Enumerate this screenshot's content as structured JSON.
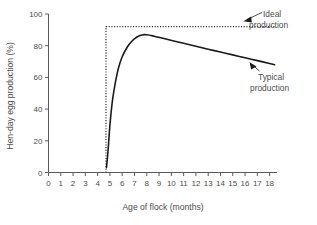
{
  "chart_data": {
    "type": "line",
    "title": "",
    "xlabel": "Age of flock (months)",
    "ylabel": "Hen-day egg production (%)",
    "xlim": [
      0,
      18.6
    ],
    "ylim": [
      0,
      100
    ],
    "grid": false,
    "legend_position": "inline-annotations",
    "x_ticks": [
      0,
      1,
      2,
      3,
      4,
      5,
      6,
      7,
      8,
      9,
      10,
      11,
      12,
      13,
      14,
      15,
      16,
      17,
      18
    ],
    "x_tick_labels": [
      "0",
      "1",
      "2",
      "3",
      "4",
      "5",
      "6",
      "7",
      "8",
      "9",
      "10",
      "11",
      "12",
      "13",
      "14",
      "15",
      "16",
      "17",
      "18"
    ],
    "y_ticks": [
      0,
      20,
      40,
      60,
      80,
      100
    ],
    "y_tick_labels": [
      "0",
      "20",
      "40",
      "60",
      "80",
      "100"
    ],
    "series": [
      {
        "name": "Ideal production",
        "style": "dotted",
        "color": "#2b2b2b",
        "x": [
          4.68,
          4.68,
          18.4
        ],
        "values": [
          0,
          92,
          92
        ]
      },
      {
        "name": "Typical production",
        "style": "solid",
        "color": "#1a1a1a",
        "x": [
          4.72,
          4.85,
          5.0,
          5.2,
          5.45,
          5.7,
          6.0,
          6.4,
          6.8,
          7.2,
          7.6,
          8.0,
          8.6,
          9.4,
          10.2,
          11.0,
          12.0,
          13.0,
          14.0,
          15.0,
          16.0,
          17.0,
          18.0,
          18.4
        ],
        "values": [
          3,
          14,
          30,
          45,
          57,
          66,
          73,
          79,
          83,
          85.5,
          86.8,
          86.9,
          86.0,
          84.5,
          83.0,
          81.5,
          79.6,
          77.8,
          76.0,
          74.2,
          72.4,
          70.6,
          68.8,
          68.0
        ]
      }
    ],
    "annotations": [
      {
        "name": "ideal-production",
        "line1": "Ideal",
        "line2": "production",
        "points_to": "dotted-ideal-line"
      },
      {
        "name": "typical-production",
        "line1": "Typical",
        "line2": "production",
        "points_to": "solid-typical-curve"
      }
    ]
  },
  "axis": {
    "x_title": "Age of flock (months)",
    "y_title": "Hen-day egg production (%)"
  },
  "annotations": {
    "ideal": {
      "line1": "Ideal",
      "line2": "production"
    },
    "typical": {
      "line1": "Typical",
      "line2": "production"
    }
  },
  "colors": {
    "axis": "#5a5a5a",
    "typical_curve": "#1a1a1a",
    "ideal_curve": "#2b2b2b",
    "text": "#4d4d4d",
    "background": "#ffffff"
  }
}
